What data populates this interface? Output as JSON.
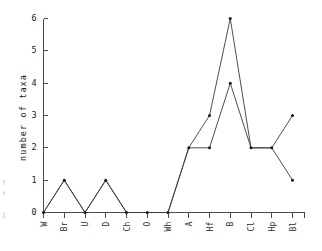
{
  "chart_data": {
    "type": "line",
    "title": "",
    "subtitle": "",
    "xlabel": "",
    "ylabel": "number of taxa",
    "categories": [
      "W",
      "Br",
      "U",
      "D",
      "Ch",
      "O",
      "Wh",
      "A",
      "Hf",
      "B",
      "Cl",
      "Hp",
      "Bl"
    ],
    "ylim": [
      0,
      6
    ],
    "yticks": [
      0,
      1,
      2,
      3,
      4,
      5,
      6
    ],
    "ytick_labels": [
      "0",
      "1",
      "2",
      "3",
      "4",
      "5",
      "6"
    ],
    "grid": false,
    "legend": "none",
    "markers": "filled-dot",
    "series": [
      {
        "name": "series-1",
        "values": [
          0,
          1,
          0,
          1,
          0,
          0,
          0,
          2,
          3,
          6,
          2,
          2,
          3
        ]
      },
      {
        "name": "series-2",
        "values": [
          0,
          1,
          0,
          1,
          0,
          0,
          0,
          2,
          2,
          4,
          2,
          2,
          1
        ]
      }
    ]
  },
  "axes": {
    "y_title": "number of taxa",
    "y_tick_labels": [
      "0",
      "1",
      "2",
      "3",
      "4",
      "5",
      "6"
    ],
    "x_tick_labels": [
      "W",
      "Br",
      "U",
      "D",
      "Ch",
      "O",
      "Wh",
      "A",
      "Hf",
      "B",
      "Cl",
      "Hp",
      "Bl"
    ]
  },
  "style": {
    "line_color": "#3a3a3a",
    "marker_color": "#1a1a1a",
    "axis_color": "#4a4a4a",
    "background": "#ffffff"
  }
}
